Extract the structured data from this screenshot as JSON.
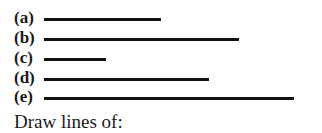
{
  "items": [
    {
      "label": "(a)",
      "length_px": 117
    },
    {
      "label": "(b)",
      "length_px": 195
    },
    {
      "label": "(c)",
      "length_px": 62
    },
    {
      "label": "(d)",
      "length_px": 165
    },
    {
      "label": "(e)",
      "length_px": 250
    }
  ],
  "caption": "Draw lines of:"
}
